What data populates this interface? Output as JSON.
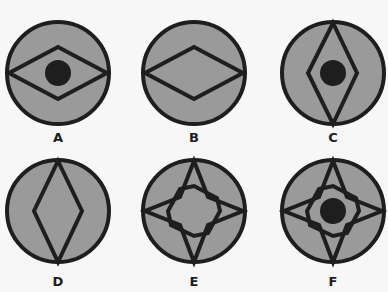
{
  "colors": {
    "background": "#f7f7f7",
    "circle_fill": "#9a9a9a",
    "stroke": "#1e1e1e",
    "dot": "#1e1e1e"
  },
  "figures": [
    {
      "label": "A",
      "shape": "horizontal-diamond",
      "has_dot": true,
      "cx": 58,
      "cy": 73
    },
    {
      "label": "B",
      "shape": "horizontal-diamond",
      "has_dot": false,
      "cx": 194,
      "cy": 73
    },
    {
      "label": "C",
      "shape": "vertical-diamond",
      "has_dot": true,
      "cx": 333,
      "cy": 73
    },
    {
      "label": "D",
      "shape": "vertical-diamond",
      "has_dot": false,
      "cx": 58,
      "cy": 211
    },
    {
      "label": "E",
      "shape": "four-point-star",
      "has_dot": false,
      "cx": 194,
      "cy": 211
    },
    {
      "label": "F",
      "shape": "four-point-star",
      "has_dot": true,
      "cx": 333,
      "cy": 211
    }
  ]
}
